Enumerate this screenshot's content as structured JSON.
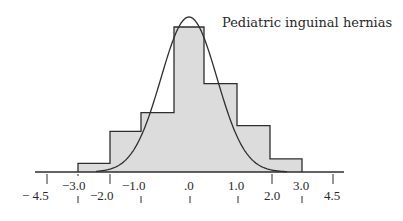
{
  "chart_data": {
    "type": "bar",
    "title": "Pediatric inguinal hernias",
    "xlabel": "",
    "ylabel": "",
    "grid": false,
    "legend": null,
    "bins": [
      {
        "from": -3.0,
        "to": -2.0,
        "value": 6
      },
      {
        "from": -2.0,
        "to": -1.0,
        "value": 28
      },
      {
        "from": -1.0,
        "to": -0.0,
        "value": 41
      },
      {
        "from": 0.0,
        "to": 0.5,
        "value": 100
      },
      {
        "from": 0.5,
        "to": 1.0,
        "value": 61
      },
      {
        "from": 1.0,
        "to": 2.0,
        "value": 32
      },
      {
        "from": 2.0,
        "to": 3.0,
        "value": 9
      }
    ],
    "categories": [
      "-3.0 to -2.0",
      "-2.0 to -1.0",
      "-1.0 to .0",
      ".0 peak",
      "to 1.0",
      "1.0 to 2.0",
      "2.0 to 3.0"
    ],
    "values": [
      6,
      28,
      41,
      100,
      61,
      32,
      9
    ],
    "curve": {
      "type": "normal",
      "peak_value": 106
    },
    "x_tick_labels_upper": [
      "- 4.5",
      "-2.0",
      "2.0",
      "4.5"
    ],
    "x_tick_labels_lower": [
      "-3.0",
      "-1.0",
      ".0",
      "1.0",
      "3.0"
    ],
    "xlim": [
      -4.5,
      4.5
    ],
    "colors": {
      "fill": "#dcdcdc",
      "line": "#2e2e2e"
    }
  },
  "labels": {
    "title": "Pediatric inguinal hernias",
    "ticks": [
      {
        "text": "− 4.5",
        "x": 22,
        "y": 200
      },
      {
        "text": "−3.0",
        "x": 62,
        "y": 190
      },
      {
        "text": "−2.0",
        "x": 90,
        "y": 200
      },
      {
        "text": "−1.0",
        "x": 122,
        "y": 190
      },
      {
        "text": ".0",
        "x": 184,
        "y": 190
      },
      {
        "text": "1.0",
        "x": 228,
        "y": 190
      },
      {
        "text": "2.0",
        "x": 264,
        "y": 200
      },
      {
        "text": "3.0",
        "x": 293,
        "y": 190
      },
      {
        "text": "4.5",
        "x": 324,
        "y": 200
      }
    ]
  }
}
